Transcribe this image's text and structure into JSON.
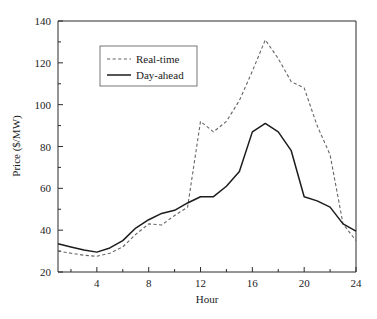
{
  "chart_data": {
    "type": "line",
    "title": "",
    "xlabel": "Hour",
    "ylabel": "Price ($/MW)",
    "xlim": [
      1,
      24
    ],
    "ylim": [
      20,
      140
    ],
    "xticks": [
      4,
      8,
      12,
      16,
      20,
      24
    ],
    "yticks": [
      20,
      40,
      60,
      80,
      100,
      120,
      140
    ],
    "xtick_labels": [
      "4",
      "8",
      "12",
      "16",
      "20",
      "24"
    ],
    "ytick_labels": [
      "20",
      "40",
      "60",
      "80",
      "100",
      "120",
      "140"
    ],
    "grid": false,
    "legend_position": "upper-left-inside",
    "x": [
      1,
      2,
      3,
      4,
      5,
      6,
      7,
      8,
      9,
      10,
      11,
      12,
      13,
      14,
      15,
      16,
      17,
      18,
      19,
      20,
      21,
      22,
      23,
      24
    ],
    "series": [
      {
        "name": "Real-time",
        "style": "dashed",
        "color": "#666666",
        "values": [
          30,
          29,
          28,
          27.5,
          29,
          32,
          38,
          43,
          42.5,
          47,
          51,
          92,
          87,
          92,
          102,
          116,
          131,
          122,
          111,
          108,
          90,
          76,
          43,
          35
        ]
      },
      {
        "name": "Day-ahead",
        "style": "solid",
        "color": "#1c1c1c",
        "values": [
          33.5,
          32,
          30.5,
          29.5,
          31.5,
          35,
          41,
          45,
          48,
          49.5,
          53,
          56,
          56,
          61,
          68,
          87,
          91,
          87,
          78,
          56,
          54,
          51,
          43,
          39.5
        ]
      }
    ]
  },
  "legend": {
    "entries": [
      {
        "label": "Real-time"
      },
      {
        "label": "Day-ahead"
      }
    ]
  },
  "axes": {
    "x_title": "Hour",
    "y_title": "Price ($/MW)"
  }
}
